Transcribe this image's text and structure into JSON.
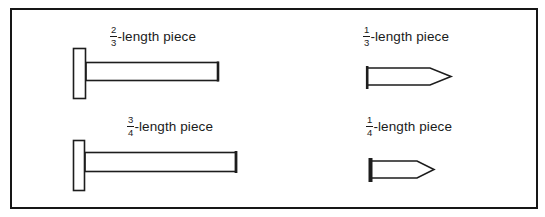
{
  "colors": {
    "ink": "#1d1d1d",
    "background": "#ffffff"
  },
  "pieces": [
    {
      "id": "two-thirds",
      "numerator": "2",
      "denominator": "3",
      "suffix": "-length piece"
    },
    {
      "id": "one-third",
      "numerator": "1",
      "denominator": "3",
      "suffix": "-length piece"
    },
    {
      "id": "three-fourths",
      "numerator": "3",
      "denominator": "4",
      "suffix": "-length piece"
    },
    {
      "id": "one-fourth",
      "numerator": "1",
      "denominator": "4",
      "suffix": "-length piece"
    }
  ]
}
